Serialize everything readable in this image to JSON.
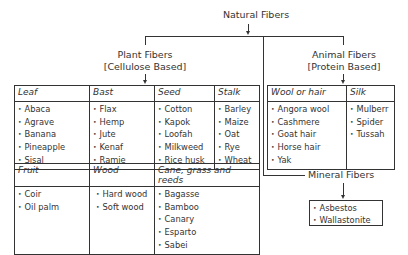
{
  "root": {
    "label": "Natural Fibers"
  },
  "plant": {
    "title": "Plant Fibers",
    "subtitle": "[Cellulose Based]",
    "row1": [
      {
        "header": "Leaf",
        "items": [
          "Abaca",
          "Agrave",
          "Banana",
          "Pineapple",
          "Sisal"
        ]
      },
      {
        "header": "Bast",
        "items": [
          "Flax",
          "Hemp",
          "Jute",
          "Kenaf",
          "Ramie"
        ]
      },
      {
        "header": "Seed",
        "items": [
          "Cotton",
          "Kapok",
          "Loofah",
          "Milkweed",
          "Rice husk"
        ]
      },
      {
        "header": "Stalk",
        "items": [
          "Barley",
          "Maize",
          "Oat",
          "Rye",
          "Wheat"
        ]
      }
    ],
    "row2": [
      {
        "header": "Fruit",
        "items": [
          "Coir",
          "Oil palm"
        ]
      },
      {
        "header": "Wood",
        "items": [
          "Hard wood",
          "Soft wood"
        ]
      },
      {
        "header": "Cane, grass and reeds",
        "items": [
          "Bagasse",
          "Bamboo",
          "Canary",
          "Esparto",
          "Sabei"
        ]
      }
    ]
  },
  "animal": {
    "title": "Animal Fibers",
    "subtitle": "[Protein Based]",
    "columns": [
      {
        "header": "Wool or hair",
        "items": [
          "Angora wool",
          "Cashmere",
          "Goat hair",
          "Horse hair",
          "Yak"
        ]
      },
      {
        "header": "Silk",
        "items": [
          "Mulberr",
          "Spider",
          "Tussah"
        ]
      }
    ]
  },
  "mineral": {
    "title": "Mineral Fibers",
    "items": [
      "Asbestos",
      "Wallastonite"
    ]
  }
}
